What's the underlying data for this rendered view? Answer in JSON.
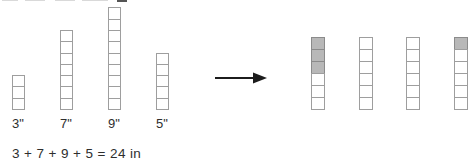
{
  "figure": {
    "left_stacks": [
      {
        "label": "3\"",
        "count": 3,
        "shaded_top": 0
      },
      {
        "label": "7\"",
        "count": 7,
        "shaded_top": 0
      },
      {
        "label": "9\"",
        "count": 9,
        "shaded_top": 0
      },
      {
        "label": "5\"",
        "count": 5,
        "shaded_top": 0
      }
    ],
    "right_stacks": [
      {
        "count": 6,
        "shaded_top": 3
      },
      {
        "count": 6,
        "shaded_top": 0
      },
      {
        "count": 6,
        "shaded_top": 0
      },
      {
        "count": 6,
        "shaded_top": 1
      }
    ],
    "equation": "3 + 7 + 9 + 5 = 24 in",
    "colors": {
      "background": "#ffffff",
      "square_border": "#9e9e9e",
      "shaded_fill": "#b8b8b8",
      "shaded_border": "#8b8b8b",
      "arrow": "#1c1c1c",
      "text": "#2e2e2e"
    }
  }
}
